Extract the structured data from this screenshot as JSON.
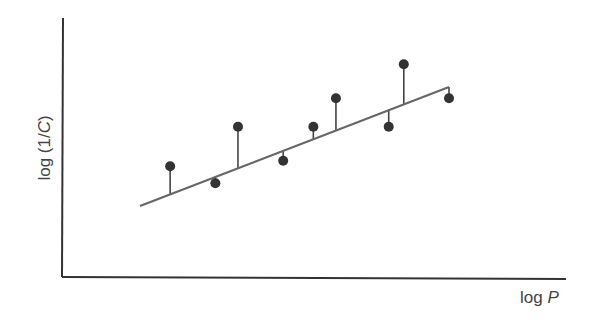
{
  "chart_data": {
    "type": "scatter",
    "title": "",
    "xlabel": "log P",
    "ylabel": "log (1/C)",
    "xlabel_parts": {
      "prefix": "log ",
      "var": "P"
    },
    "ylabel_parts": {
      "prefix": "log (1/",
      "var": "C",
      "suffix": ")"
    },
    "grid": false,
    "legend": null,
    "ticks": false,
    "x": [
      1.4,
      2.0,
      2.3,
      2.9,
      3.3,
      3.6,
      4.3,
      4.5,
      5.1
    ],
    "y": [
      3.7,
      3.4,
      4.4,
      3.8,
      4.4,
      4.9,
      4.4,
      5.5,
      4.9
    ],
    "fit_line": {
      "x": [
        1.0,
        5.1
      ],
      "y": [
        3.0,
        5.1
      ]
    },
    "annotations": "Vertical residual lines connect each point to the regression line",
    "colors": {
      "points": "#333333",
      "line": "#666666",
      "axes": "#333333"
    }
  }
}
